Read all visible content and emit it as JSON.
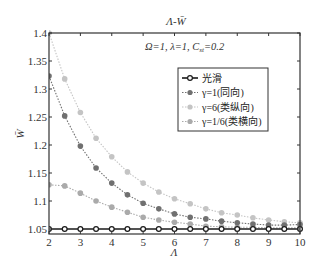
{
  "chart_data": {
    "type": "line",
    "title": "Λ-W̄",
    "annotation": "Ω=1, λ=1, C_st=0.2",
    "annotation_parts": {
      "a": "Ω=1, λ=1, C",
      "sub": "st",
      "b": "=0.2"
    },
    "xlabel": "Λ",
    "ylabel": "W̄",
    "xlim": [
      2,
      10
    ],
    "ylim": [
      1.045,
      1.4
    ],
    "grid": false,
    "legend_position": "upper right",
    "xticks": [
      2,
      3,
      4,
      5,
      6,
      7,
      8,
      9,
      10
    ],
    "yticks": [
      1.05,
      1.1,
      1.15,
      1.2,
      1.25,
      1.3,
      1.35,
      1.4
    ],
    "x": [
      2,
      2.5,
      3,
      3.5,
      4,
      4.5,
      5,
      5.5,
      6,
      6.5,
      7,
      7.5,
      8,
      8.5,
      9,
      9.5,
      10
    ],
    "series": [
      {
        "name": "光滑",
        "color": "#1a1a1a",
        "marker": "open-circle",
        "line": "solid",
        "values": [
          1.05,
          1.05,
          1.05,
          1.05,
          1.05,
          1.05,
          1.05,
          1.05,
          1.05,
          1.05,
          1.05,
          1.05,
          1.05,
          1.05,
          1.05,
          1.05,
          1.05
        ]
      },
      {
        "name": "γ=1(同向)",
        "color": "#707070",
        "marker": "filled-circle",
        "line": "dotted",
        "values": [
          1.323,
          1.252,
          1.198,
          1.159,
          1.132,
          1.111,
          1.096,
          1.086,
          1.077,
          1.071,
          1.068,
          1.064,
          1.061,
          1.059,
          1.057,
          1.057,
          1.058
        ]
      },
      {
        "name": "γ=6(类纵向)",
        "color": "#c4c4c4",
        "marker": "filled-circle",
        "line": "dotted",
        "values": [
          1.4,
          1.318,
          1.258,
          1.212,
          1.179,
          1.152,
          1.132,
          1.116,
          1.104,
          1.095,
          1.086,
          1.079,
          1.075,
          1.07,
          1.066,
          1.063,
          1.061
        ]
      },
      {
        "name": "γ=1/6(类横向)",
        "color": "#aaaaaa",
        "marker": "filled-circle",
        "line": "dotted",
        "values": [
          1.129,
          1.127,
          1.114,
          1.1,
          1.089,
          1.08,
          1.071,
          1.066,
          1.062,
          1.059,
          1.055,
          1.054,
          1.053,
          1.053,
          1.052,
          1.052,
          1.052
        ]
      }
    ]
  }
}
